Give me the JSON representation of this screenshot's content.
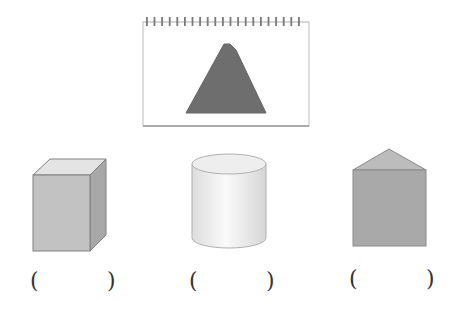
{
  "notebook": {
    "ring_count": 21,
    "shape_shown": "triangle",
    "triangle_color": "#6e6e6e"
  },
  "solids": [
    {
      "id": "cube",
      "name": "cuboid",
      "color": "#b9b9b9"
    },
    {
      "id": "cylinder",
      "name": "cylinder",
      "color": "#e6e6e6"
    },
    {
      "id": "prism",
      "name": "triangular-prism",
      "color": "#a9a9a9"
    }
  ],
  "answers": [
    {
      "open": "(",
      "close": ")",
      "value": ""
    },
    {
      "open": "(",
      "close": ")",
      "value": ""
    },
    {
      "open": "(",
      "close": ")",
      "value": ""
    }
  ]
}
